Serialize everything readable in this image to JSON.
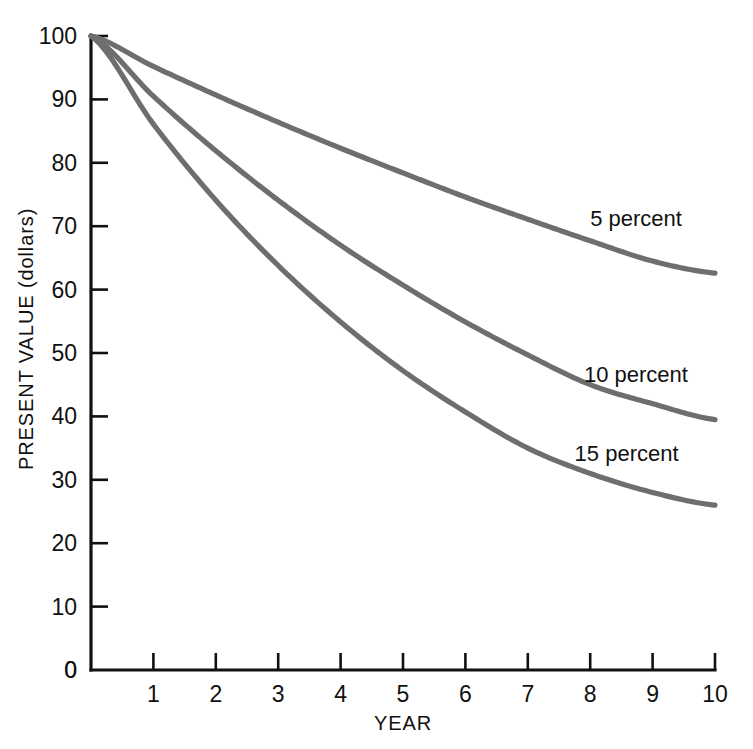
{
  "chart_data": {
    "type": "line",
    "title": "",
    "subtitle": "",
    "xlabel": "YEAR",
    "ylabel": "PRESENT VALUE (dollars)",
    "xlim": [
      0,
      10
    ],
    "ylim": [
      0,
      100
    ],
    "x_ticks": [
      0,
      1,
      2,
      3,
      4,
      5,
      6,
      7,
      8,
      9,
      10
    ],
    "x_tick_labels": [
      "0",
      "1",
      "2",
      "3",
      "4",
      "5",
      "6",
      "7",
      "8",
      "9",
      "10"
    ],
    "y_ticks": [
      0,
      10,
      20,
      30,
      40,
      50,
      60,
      70,
      80,
      90,
      100
    ],
    "y_tick_labels": [
      "0",
      "10",
      "20",
      "30",
      "40",
      "50",
      "60",
      "70",
      "80",
      "90",
      "100"
    ],
    "grid": false,
    "legend_position": "inline-right",
    "x": [
      0,
      1,
      2,
      3,
      4,
      5,
      6,
      7,
      8,
      9,
      10
    ],
    "series": [
      {
        "name": "5 percent",
        "rate_percent": 5,
        "color": "#6e6e6e",
        "values": [
          100.0,
          95.2,
          90.7,
          86.4,
          82.3,
          78.4,
          74.6,
          71.1,
          67.7,
          64.5,
          62.6
        ],
        "label": "5 percent",
        "label_x": 8.0,
        "label_y": 70.0
      },
      {
        "name": "10 percent",
        "rate_percent": 10,
        "color": "#6e6e6e",
        "values": [
          100.0,
          90.5,
          81.9,
          74.1,
          67.0,
          60.7,
          54.9,
          49.7,
          45.0,
          42.0,
          39.5
        ],
        "label": "10 percent",
        "label_x": 7.9,
        "label_y": 45.5
      },
      {
        "name": "15 percent",
        "rate_percent": 15,
        "color": "#6e6e6e",
        "values": [
          100.0,
          86.1,
          74.1,
          63.8,
          54.9,
          47.2,
          40.7,
          35.0,
          31.0,
          28.0,
          26.0
        ],
        "label": "15 percent",
        "label_x": 7.75,
        "label_y": 33.0
      }
    ],
    "colors": {
      "curve": "#6e6e6e",
      "axis": "#111111",
      "text": "#111111",
      "background": "#ffffff"
    }
  }
}
